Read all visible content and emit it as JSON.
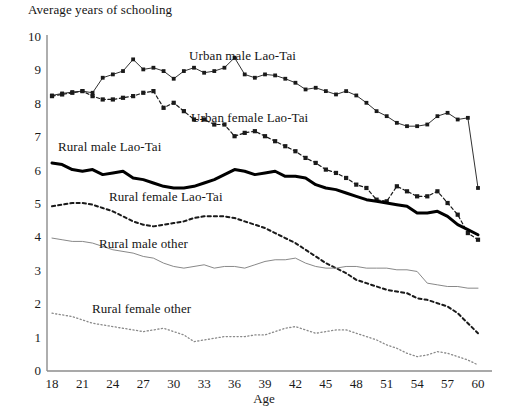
{
  "chart_data": {
    "type": "line",
    "title": "Average years of schooling",
    "xlabel": "Age",
    "ylabel": "",
    "xlim": [
      18,
      60
    ],
    "ylim": [
      0,
      10
    ],
    "grid": false,
    "legend_position": "inline-annotations",
    "x_ticks": [
      18,
      21,
      24,
      27,
      30,
      33,
      36,
      39,
      42,
      45,
      48,
      51,
      54,
      57,
      60
    ],
    "y_ticks": [
      0,
      1,
      2,
      3,
      4,
      5,
      6,
      7,
      8,
      9,
      10
    ],
    "x": [
      18,
      19,
      20,
      21,
      22,
      23,
      24,
      25,
      26,
      27,
      28,
      29,
      30,
      31,
      32,
      33,
      34,
      35,
      36,
      37,
      38,
      39,
      40,
      41,
      42,
      43,
      44,
      45,
      46,
      47,
      48,
      49,
      50,
      51,
      52,
      53,
      54,
      55,
      56,
      57,
      58,
      59,
      60
    ],
    "series": [
      {
        "name": "Urban male Lao-Tai",
        "style": "solid-thin-with-markers",
        "color": "#1a1a1a",
        "values": [
          8.22,
          8.28,
          8.32,
          8.35,
          8.3,
          8.75,
          8.85,
          8.95,
          9.3,
          9.0,
          9.05,
          8.95,
          8.72,
          8.95,
          9.05,
          8.9,
          8.95,
          9.05,
          9.35,
          8.85,
          8.75,
          8.85,
          8.82,
          8.72,
          8.6,
          8.4,
          8.45,
          8.35,
          8.25,
          8.35,
          8.22,
          8.0,
          7.75,
          7.6,
          7.4,
          7.3,
          7.3,
          7.35,
          7.6,
          7.7,
          7.5,
          7.55,
          5.45
        ]
      },
      {
        "name": "Urban female Lao-Tai",
        "style": "dashed-thick-with-markers",
        "color": "#1a1a1a",
        "values": [
          8.2,
          8.25,
          8.3,
          8.35,
          8.2,
          8.1,
          8.1,
          8.15,
          8.2,
          8.3,
          8.35,
          7.85,
          8.0,
          7.75,
          7.5,
          7.5,
          7.35,
          7.35,
          7.0,
          7.1,
          7.15,
          7.0,
          6.85,
          6.7,
          6.55,
          6.35,
          6.2,
          6.0,
          5.9,
          5.75,
          5.55,
          5.45,
          5.1,
          5.05,
          5.5,
          5.35,
          5.2,
          5.2,
          5.35,
          5.0,
          4.65,
          4.1,
          3.9
        ]
      },
      {
        "name": "Rural male Lao-Tai",
        "style": "solid-heavy",
        "color": "#000000",
        "values": [
          6.2,
          6.15,
          6.0,
          5.95,
          6.0,
          5.85,
          5.9,
          5.95,
          5.75,
          5.7,
          5.6,
          5.5,
          5.45,
          5.45,
          5.5,
          5.6,
          5.7,
          5.85,
          6.0,
          5.95,
          5.85,
          5.9,
          5.95,
          5.8,
          5.8,
          5.75,
          5.55,
          5.45,
          5.4,
          5.3,
          5.2,
          5.1,
          5.05,
          5.0,
          4.95,
          4.9,
          4.7,
          4.7,
          4.75,
          4.6,
          4.35,
          4.2,
          4.05
        ]
      },
      {
        "name": "Rural female Lao-Tai",
        "style": "dashed-medium",
        "color": "#1a1a1a",
        "values": [
          4.9,
          4.95,
          5.0,
          5.0,
          4.95,
          4.85,
          4.75,
          4.6,
          4.45,
          4.35,
          4.3,
          4.35,
          4.4,
          4.45,
          4.55,
          4.6,
          4.6,
          4.6,
          4.55,
          4.45,
          4.35,
          4.25,
          4.1,
          3.95,
          3.8,
          3.6,
          3.4,
          3.2,
          3.05,
          2.9,
          2.7,
          2.6,
          2.5,
          2.4,
          2.35,
          2.3,
          2.15,
          2.1,
          2.0,
          1.9,
          1.7,
          1.4,
          1.1
        ]
      },
      {
        "name": "Rural male other",
        "style": "solid-thin",
        "color": "#7a7a7a",
        "values": [
          3.95,
          3.9,
          3.85,
          3.85,
          3.8,
          3.7,
          3.6,
          3.55,
          3.5,
          3.4,
          3.35,
          3.2,
          3.1,
          3.05,
          3.1,
          3.15,
          3.05,
          3.1,
          3.1,
          3.05,
          3.15,
          3.25,
          3.3,
          3.3,
          3.35,
          3.2,
          3.1,
          3.05,
          3.05,
          3.1,
          3.1,
          3.05,
          3.05,
          3.05,
          3.0,
          3.0,
          2.95,
          2.6,
          2.55,
          2.5,
          2.5,
          2.45,
          2.45
        ]
      },
      {
        "name": "Rural female other",
        "style": "dotted-fine",
        "color": "#8a8a8a",
        "values": [
          1.7,
          1.65,
          1.6,
          1.5,
          1.4,
          1.35,
          1.3,
          1.25,
          1.2,
          1.15,
          1.2,
          1.25,
          1.15,
          1.05,
          0.85,
          0.9,
          0.95,
          1.0,
          1.0,
          1.0,
          1.05,
          1.05,
          1.15,
          1.25,
          1.3,
          1.2,
          1.1,
          1.15,
          1.2,
          1.2,
          1.1,
          1.0,
          0.9,
          0.75,
          0.65,
          0.5,
          0.4,
          0.45,
          0.55,
          0.5,
          0.4,
          0.3,
          0.15
        ]
      }
    ],
    "annotations": [
      {
        "text": "Urban male Lao-Tai",
        "x_px": 189,
        "y_px": 48
      },
      {
        "text": "Urban female Lao-Tai",
        "x_px": 191,
        "y_px": 110
      },
      {
        "text": "Rural male Lao-Tai",
        "x_px": 58,
        "y_px": 139
      },
      {
        "text": "Rural female Lao-Tai",
        "x_px": 109,
        "y_px": 189
      },
      {
        "text": "Rural male other",
        "x_px": 99,
        "y_px": 236
      },
      {
        "text": "Rural female other",
        "x_px": 92,
        "y_px": 301
      }
    ]
  },
  "colors": {
    "axis": "#8c8c8c",
    "text": "#141414",
    "dark_series": "#1a1a1a",
    "grey_series": "#7a7a7a",
    "light_series": "#8a8a8a"
  }
}
